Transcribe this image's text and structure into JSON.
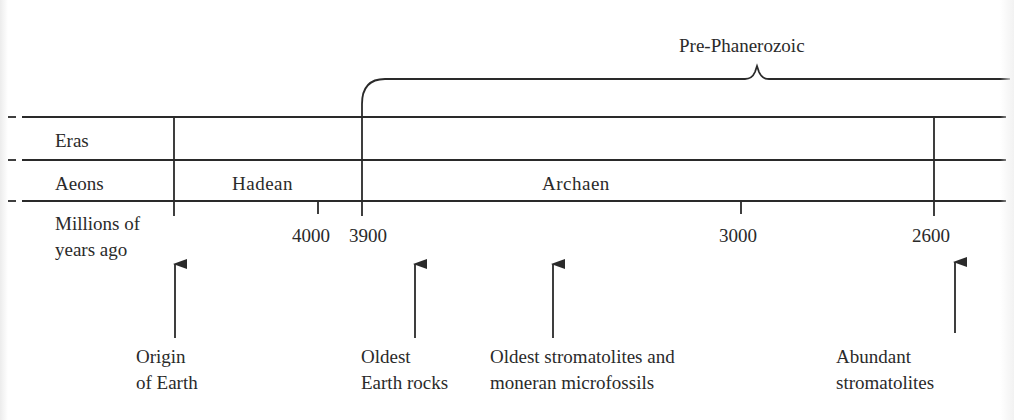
{
  "bracket": {
    "label": "Pre-Phanerozoic"
  },
  "rows": {
    "eras": "Eras",
    "aeons": "Aeons",
    "time_line1": "Millions of",
    "time_line2": "years ago"
  },
  "aeons": [
    {
      "name": "Hadean"
    },
    {
      "name": "Archaen"
    }
  ],
  "ticks": [
    {
      "label": "4000"
    },
    {
      "label": "3900"
    },
    {
      "label": "3000"
    },
    {
      "label": "2600"
    }
  ],
  "events": [
    {
      "line1": "Origin",
      "line2": "of Earth"
    },
    {
      "line1": "Oldest",
      "line2": "Earth rocks"
    },
    {
      "line1": "Oldest stromatolites and",
      "line2": "moneran microfossils"
    },
    {
      "line1": "Abundant",
      "line2": "stromatolites"
    }
  ],
  "colors": {
    "ink": "#2a2a2a",
    "background": "#ffffff"
  }
}
